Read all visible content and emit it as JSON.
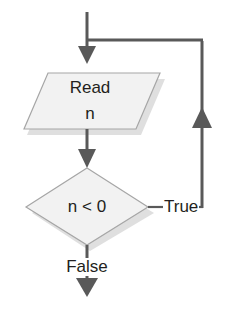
{
  "diagram": {
    "type": "flowchart",
    "background_color": "#ffffff",
    "line_color": "#595959",
    "text_color": "#231f20",
    "shape_fill": "#f2f2f2",
    "shape_stroke": "#a6a6a6",
    "shape_shadow": "#d9d9d9"
  },
  "nodes": {
    "input_read": {
      "shape": "parallelogram",
      "label_line1": "Read",
      "label_line2": "n"
    },
    "decision_negative": {
      "shape": "diamond",
      "label": "n < 0"
    }
  },
  "edges": {
    "entry": {
      "label": "",
      "from": "start",
      "to": "input_read"
    },
    "read_to_decision": {
      "label": "",
      "from": "input_read",
      "to": "decision_negative"
    },
    "decision_true": {
      "label": "True",
      "from": "decision_negative",
      "to": "input_read"
    },
    "decision_false": {
      "label": "False",
      "from": "decision_negative",
      "to": "end"
    }
  }
}
